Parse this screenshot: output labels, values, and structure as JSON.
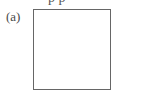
{
  "figure": {
    "top_cut_text": "p p",
    "panel_label": "(a)",
    "panel": {
      "shape": "square",
      "fill": "#ffffff",
      "border_color": "#666666"
    }
  }
}
